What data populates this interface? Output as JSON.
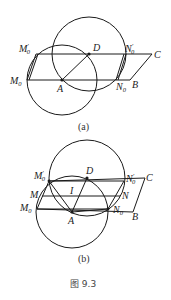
{
  "figure_caption": "图 9.3",
  "panels": [
    {
      "id": "a",
      "caption": "(a)",
      "labels": {
        "M0p": "M",
        "M0p_sub": "0",
        "M0p_prime": "′",
        "M0": "M",
        "M0_sub": "0",
        "D": "D",
        "N0p": "N",
        "N0p_sub": "0",
        "N0p_prime": "′",
        "C": "C",
        "A": "A",
        "N0": "N",
        "N0_sub": "0",
        "B": "B"
      }
    },
    {
      "id": "b",
      "caption": "(b)",
      "labels": {
        "M0p": "M",
        "M0p_sub": "0",
        "M0p_prime": "′",
        "M": "M",
        "M0": "M",
        "M0_sub": "0",
        "D": "D",
        "I": "I",
        "A": "A",
        "N0p": "N",
        "N0p_sub": "0",
        "N0p_prime": "′",
        "N": "N",
        "N0": "N",
        "N0_sub": "0",
        "C": "C",
        "B": "B"
      }
    }
  ],
  "colors": {
    "stroke": "#1a1a1a",
    "background": "#ffffff"
  }
}
